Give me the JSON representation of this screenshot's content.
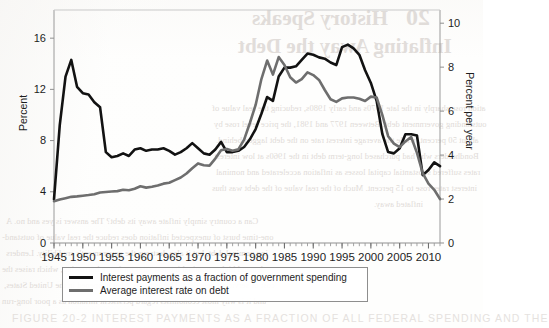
{
  "figure": {
    "caption_partial": "FIGURE 20-2   INTEREST PAYMENTS AS A FRACTION OF ALL FEDERAL SPENDING AND THE"
  },
  "bleed_through": {
    "chapter_number": "20",
    "heading_line1": "History Speaks",
    "heading_line2": "Inflating Away the Debt",
    "body_lines": [
      "ation rose sharply in the late 1970s and early 1980s, reducing the real value of",
      "outstanding government debt. Between 1977 and 1981, the price level rose by",
      "about 50 percent, while the average interest rate on the debt lagged behind.",
      "Bondholders who had purchased long-term debt in the 1960s at low interest",
      "rates suffered substantial capital losses as inflation accelerated and nominal",
      "interest rates rose to 15 percent. Much of the real value of the debt was thus",
      "inflated away.",
      "Can a country simply inflate away its debt? The answer is yes and no. A",
      "one-time burst of unexpected inflation does reduce the real value of outstand-",
      "ing nominal debt, but it also destroys the government's credibility. Lenders",
      "demand higher nominal interest rates on future borrowing, which raises the",
      "cost of servicing new debt. That is partly what happened in the United States,",
      "and it is why most economists regard persistent inflation as a poor long-run",
      "solution to fiscal imbalance."
    ]
  },
  "chart_data": {
    "type": "line",
    "title": "",
    "subtitle": "",
    "xlabel": "",
    "ylabel": "Percent",
    "y2label": "Percent per year",
    "grid": false,
    "legend_position": "bottom",
    "xlim": [
      1945,
      2012
    ],
    "ylim": [
      0,
      18.2
    ],
    "y2lim": [
      0,
      10.6
    ],
    "y_ticks": [
      0,
      4,
      8,
      12,
      16
    ],
    "y2_ticks": [
      0,
      2,
      4,
      6,
      8,
      10
    ],
    "y_tick_labels": [
      "0",
      "4",
      "8",
      "12",
      "16"
    ],
    "y2_tick_labels": [
      "0",
      "2",
      "4",
      "6",
      "8",
      "10"
    ],
    "x_ticks": [
      1945,
      1950,
      1955,
      1960,
      1965,
      1970,
      1975,
      1980,
      1985,
      1990,
      1995,
      2000,
      2005,
      2010
    ],
    "x_tick_labels": [
      "1945",
      "1950",
      "1955",
      "1960",
      "1965",
      "1970",
      "1975",
      "1980",
      "1985",
      "1990",
      "1995",
      "2000",
      "2005",
      "2010"
    ],
    "x_minor_tick_step": 1,
    "series": [
      {
        "name": "Interest payments as a fraction of government spending",
        "axis": "left",
        "color": "#121212",
        "width": 2.6,
        "x": [
          1945,
          1946,
          1947,
          1948,
          1949,
          1950,
          1951,
          1952,
          1953,
          1954,
          1955,
          1956,
          1957,
          1958,
          1959,
          1960,
          1961,
          1962,
          1963,
          1964,
          1965,
          1966,
          1967,
          1968,
          1969,
          1970,
          1971,
          1972,
          1973,
          1974,
          1975,
          1976,
          1977,
          1978,
          1979,
          1980,
          1981,
          1982,
          1983,
          1984,
          1985,
          1986,
          1987,
          1988,
          1989,
          1990,
          1991,
          1992,
          1993,
          1994,
          1995,
          1996,
          1997,
          1998,
          1999,
          2000,
          2001,
          2002,
          2003,
          2004,
          2005,
          2006,
          2007,
          2008,
          2009,
          2010,
          2011,
          2012
        ],
        "values": [
          3.4,
          9.2,
          13.0,
          14.3,
          12.2,
          11.7,
          11.6,
          11.0,
          10.6,
          7.1,
          6.7,
          6.8,
          7.0,
          6.8,
          7.3,
          7.4,
          7.2,
          7.3,
          7.3,
          7.4,
          7.2,
          6.9,
          7.1,
          7.4,
          7.8,
          7.4,
          7.0,
          6.9,
          7.3,
          7.9,
          7.1,
          7.1,
          7.2,
          7.5,
          8.1,
          8.9,
          10.1,
          11.4,
          11.1,
          13.0,
          13.7,
          13.7,
          13.8,
          14.3,
          14.8,
          14.7,
          14.5,
          14.4,
          14.1,
          13.9,
          15.3,
          15.5,
          15.2,
          14.7,
          13.5,
          12.5,
          11.1,
          8.5,
          7.1,
          7.0,
          7.4,
          8.5,
          8.5,
          8.4,
          5.3,
          5.7,
          6.3,
          6.0
        ]
      },
      {
        "name": "Average interest rate on debt",
        "axis": "right",
        "color": "#6e6e6e",
        "width": 2.6,
        "x": [
          1945,
          1946,
          1947,
          1948,
          1949,
          1950,
          1951,
          1952,
          1953,
          1954,
          1955,
          1956,
          1957,
          1958,
          1959,
          1960,
          1961,
          1962,
          1963,
          1964,
          1965,
          1966,
          1967,
          1968,
          1969,
          1970,
          1971,
          1972,
          1973,
          1974,
          1975,
          1976,
          1977,
          1978,
          1979,
          1980,
          1981,
          1982,
          1983,
          1984,
          1985,
          1986,
          1987,
          1988,
          1989,
          1990,
          1991,
          1992,
          1993,
          1994,
          1995,
          1996,
          1997,
          1998,
          1999,
          2000,
          2001,
          2002,
          2003,
          2004,
          2005,
          2006,
          2007,
          2008,
          2009,
          2010,
          2011,
          2012
        ],
        "values": [
          1.9,
          1.98,
          2.04,
          2.1,
          2.12,
          2.15,
          2.18,
          2.22,
          2.3,
          2.32,
          2.34,
          2.36,
          2.42,
          2.4,
          2.47,
          2.58,
          2.52,
          2.56,
          2.62,
          2.7,
          2.74,
          2.86,
          2.98,
          3.16,
          3.4,
          3.62,
          3.54,
          3.52,
          3.84,
          4.22,
          4.28,
          4.2,
          4.26,
          4.7,
          5.46,
          6.28,
          7.46,
          8.3,
          7.66,
          8.46,
          8.1,
          7.54,
          7.3,
          7.46,
          7.76,
          7.64,
          7.42,
          6.96,
          6.54,
          6.42,
          6.58,
          6.62,
          6.62,
          6.56,
          6.46,
          6.66,
          6.62,
          5.82,
          4.86,
          4.52,
          4.36,
          4.62,
          4.82,
          4.1,
          3.18,
          2.7,
          2.42,
          2.0
        ]
      }
    ]
  },
  "axes": {
    "left_title": "Percent",
    "right_title": "Percent per year"
  },
  "legend": {
    "items": [
      {
        "label": "Interest payments as a fraction of government spending",
        "color": "#121212"
      },
      {
        "label": "Average interest rate on debt",
        "color": "#6e6e6e"
      }
    ]
  }
}
